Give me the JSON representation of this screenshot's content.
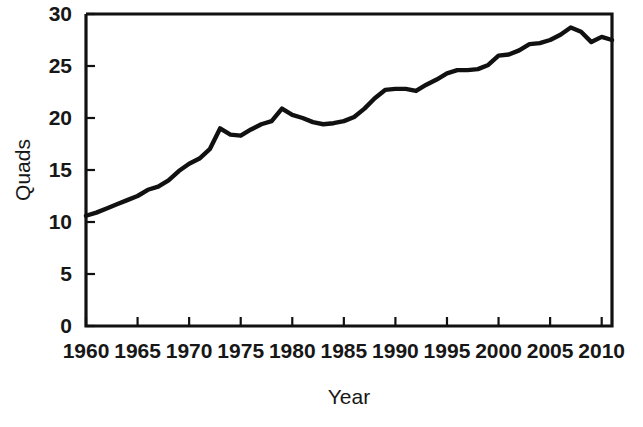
{
  "chart_data": {
    "type": "line",
    "title": "",
    "xlabel": "Year",
    "ylabel": "Quads",
    "xlim": [
      1960,
      2011
    ],
    "ylim": [
      0,
      30
    ],
    "grid": false,
    "legend": null,
    "xticks": [
      1960,
      1965,
      1970,
      1975,
      1980,
      1985,
      1990,
      1995,
      2000,
      2005,
      2010
    ],
    "xtick_labels": [
      "1960",
      "1965",
      "1970",
      "1975",
      "1980",
      "1985",
      "1990",
      "1995",
      "2000",
      "2005",
      "2010"
    ],
    "yticks": [
      0,
      5,
      10,
      15,
      20,
      25,
      30
    ],
    "ytick_labels": [
      "0",
      "5",
      "10",
      "15",
      "20",
      "25",
      "30"
    ],
    "line_color": "#111111",
    "series": [
      {
        "name": "Quads",
        "x": [
          1960,
          1961,
          1962,
          1963,
          1964,
          1965,
          1966,
          1967,
          1968,
          1969,
          1970,
          1971,
          1972,
          1973,
          1974,
          1975,
          1976,
          1977,
          1978,
          1979,
          1980,
          1981,
          1982,
          1983,
          1984,
          1985,
          1986,
          1987,
          1988,
          1989,
          1990,
          1991,
          1992,
          1993,
          1994,
          1995,
          1996,
          1997,
          1998,
          1999,
          2000,
          2001,
          2002,
          2003,
          2004,
          2005,
          2006,
          2007,
          2008,
          2009,
          2010,
          2011
        ],
        "values": [
          10.6,
          10.9,
          11.3,
          11.7,
          12.1,
          12.5,
          13.1,
          13.4,
          14.0,
          14.9,
          15.6,
          16.1,
          17.0,
          19.0,
          18.4,
          18.3,
          18.9,
          19.4,
          19.7,
          20.9,
          20.3,
          20.0,
          19.6,
          19.4,
          19.5,
          19.7,
          20.1,
          20.9,
          21.9,
          22.7,
          22.8,
          22.8,
          22.6,
          23.2,
          23.7,
          24.3,
          24.6,
          24.6,
          24.7,
          25.1,
          26.0,
          26.1,
          26.5,
          27.1,
          27.2,
          27.5,
          28.0,
          28.7,
          28.3,
          27.3,
          27.8,
          27.5
        ]
      }
    ]
  },
  "labels": {
    "x_axis_title": "Year",
    "y_axis_title": "Quads"
  }
}
